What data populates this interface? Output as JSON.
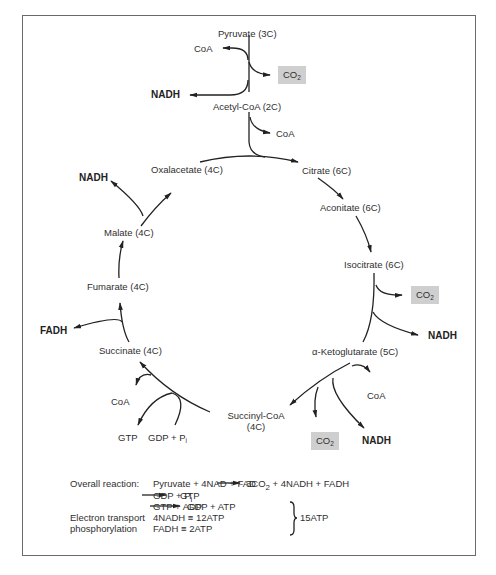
{
  "diagram": {
    "intermediates": {
      "pyruvate": "Pyruvate (3C)",
      "acetyl_coa": "Acetyl-CoA (2C)",
      "citrate": "Citrate (6C)",
      "aconitate": "Aconitate (6C)",
      "isocitrate": "Isocitrate (6C)",
      "ketoglutarate": "α-Ketoglutarate (5C)",
      "succinyl_coa_line1": "Succinyl-CoA",
      "succinyl_coa_line2": "(4C)",
      "succinate": "Succinate (4C)",
      "fumarate": "Fumarate (4C)",
      "malate": "Malate (4C)",
      "oxalacetate": "Oxalacetate (4C)"
    },
    "side_products": {
      "coa_in_pyruvate": "CoA",
      "co2_pyruvate": "CO",
      "nadh_pyruvate": "NADH",
      "coa_out_acetyl": "CoA",
      "co2_isocitrate": "CO",
      "nadh_isocitrate": "NADH",
      "coa_ketoglutarate": "CoA",
      "co2_ketoglutarate": "CO",
      "nadh_ketoglutarate": "NADH",
      "coa_succinyl": "CoA",
      "gtp": "GTP",
      "gdp_pi": "GDP + P",
      "gdp_pi_sub": "i",
      "fadh": "FADH",
      "nadh_malate": "NADH",
      "co2_sub": "2"
    },
    "highlight_color": "#cfcfcf"
  },
  "summary": {
    "overall_label": "Overall reaction:",
    "overall_reactants": "Pyruvate + 4NAD + FAD",
    "overall_products_pre": "3CO",
    "overall_products_sub": "2",
    "overall_products_post": " + 4NADH + FADH",
    "line2_left": "GDP + P",
    "line2_sub": "i",
    "line2_right": "GTP",
    "line3_left": "GTP + ADP",
    "line3_right": "GDP + ATP",
    "et_label_1": "Electron transport",
    "et_label_2": "phosphorylation",
    "et_line1": "4NADH ≡ 12ATP",
    "et_line2": "FADH ≡ 2ATP",
    "total": "15ATP"
  }
}
